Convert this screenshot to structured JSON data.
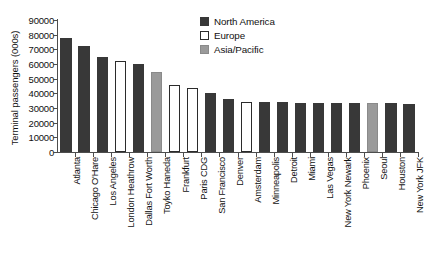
{
  "chart_data": {
    "type": "bar",
    "title": "",
    "xlabel": "",
    "ylabel": "Terminal passengers (000s)",
    "ylim": [
      0,
      90000
    ],
    "ytick_step": 10000,
    "yticks": [
      0,
      10000,
      20000,
      30000,
      40000,
      50000,
      60000,
      70000,
      80000,
      90000
    ],
    "ytick_labels": [
      "0",
      "10000",
      "20000",
      "30000",
      "40000",
      "50000",
      "60000",
      "70000",
      "80000",
      "90000"
    ],
    "grid": false,
    "legend_position": "top-right",
    "categories": [
      "Atlanta",
      "Chicago O'Hare",
      "Los Angeles",
      "London Heathrow",
      "Dallas Fort Worth",
      "Toyko Haneda",
      "Frankfurt",
      "Paris CDG",
      "San Francisco",
      "Denver",
      "Amsterdam",
      "Minneapolis",
      "Detroit",
      "Miami",
      "Las Vegas",
      "New York Newark",
      "Phoenix",
      "Seoul",
      "Houston",
      "New York JFK"
    ],
    "values": [
      78000,
      72000,
      64500,
      62000,
      60200,
      54500,
      45700,
      43500,
      40000,
      36200,
      34000,
      34000,
      34000,
      33700,
      33600,
      33500,
      33400,
      33300,
      33200,
      32800
    ],
    "regions": [
      "North America",
      "North America",
      "North America",
      "Europe",
      "North America",
      "Asia/Pacific",
      "Europe",
      "Europe",
      "North America",
      "North America",
      "Europe",
      "North America",
      "North America",
      "North America",
      "North America",
      "North America",
      "North America",
      "Asia/Pacific",
      "North America",
      "North America"
    ],
    "legend": [
      {
        "label": "North America",
        "key": "north-america",
        "color": "#383838"
      },
      {
        "label": "Europe",
        "key": "europe",
        "color": "#ffffff"
      },
      {
        "label": "Asia/Pacific",
        "key": "asia-pacific",
        "color": "#9a9a9a"
      }
    ]
  }
}
